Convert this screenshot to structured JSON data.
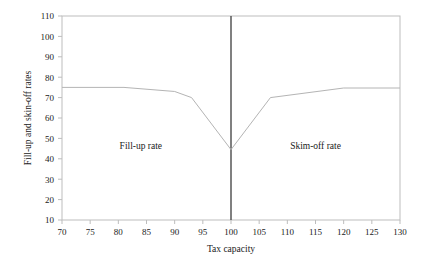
{
  "chart_data": {
    "type": "line",
    "title": "",
    "subtitle": "",
    "xlabel": "Tax capacity",
    "ylabel": "Fill-up and skin-off rates",
    "xlim": [
      70,
      130
    ],
    "ylim": [
      10,
      110
    ],
    "xticks": [
      70,
      75,
      80,
      85,
      90,
      95,
      100,
      105,
      110,
      115,
      120,
      125,
      130
    ],
    "yticks": [
      10,
      20,
      30,
      40,
      50,
      60,
      70,
      80,
      90,
      100,
      110
    ],
    "xtick_labels": [
      "70",
      "75",
      "80",
      "85",
      "90",
      "95",
      "100",
      "105",
      "110",
      "115",
      "120",
      "125",
      "130"
    ],
    "ytick_labels": [
      "10",
      "20",
      "30",
      "40",
      "50",
      "60",
      "70",
      "80",
      "90",
      "100",
      "110"
    ],
    "grid": false,
    "legend": "none",
    "series": [
      {
        "name": "Fill-up and skim-off rate",
        "color": "#b4b4b4",
        "x": [
          70,
          81,
          90,
          93,
          100,
          107,
          120,
          130
        ],
        "values": [
          75,
          75,
          73,
          70,
          44.5,
          70,
          74.7,
          74.7
        ]
      }
    ],
    "reference_lines": [
      {
        "name": "tax-capacity-100",
        "orientation": "vertical",
        "x": 100,
        "color": "#4a4a4a"
      }
    ],
    "annotations": [
      {
        "text": "Fill-up rate",
        "x": 84,
        "y": 45
      },
      {
        "text": "Skim-off rate",
        "x": 115,
        "y": 45
      }
    ]
  },
  "figure": {
    "background_color": "#ffffff",
    "axis_color": "#b9b9b9",
    "text_color": "#1a1a1a"
  }
}
